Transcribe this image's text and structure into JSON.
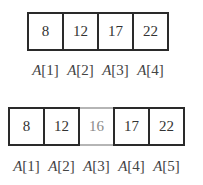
{
  "before": {
    "cells": [
      {
        "value": "8",
        "label_name": "A",
        "label_index": "[1]",
        "state": "normal"
      },
      {
        "value": "12",
        "label_name": "A",
        "label_index": "[2]",
        "state": "normal"
      },
      {
        "value": "17",
        "label_name": "A",
        "label_index": "[3]",
        "state": "normal"
      },
      {
        "value": "22",
        "label_name": "A",
        "label_index": "[4]",
        "state": "normal"
      }
    ]
  },
  "after": {
    "cells": [
      {
        "value": "8",
        "label_name": "A",
        "label_index": "[1]",
        "state": "normal"
      },
      {
        "value": "12",
        "label_name": "A",
        "label_index": "[2]",
        "state": "normal"
      },
      {
        "value": "16",
        "label_name": "A",
        "label_index": "[3]",
        "state": "inserted"
      },
      {
        "value": "17",
        "label_name": "A",
        "label_index": "[4]",
        "state": "normal"
      },
      {
        "value": "22",
        "label_name": "A",
        "label_index": "[5]",
        "state": "normal"
      }
    ]
  },
  "colors": {
    "border": "#2a2a2a",
    "inserted_border": "#b5b5b5",
    "inserted_text": "#8a8a8a"
  }
}
